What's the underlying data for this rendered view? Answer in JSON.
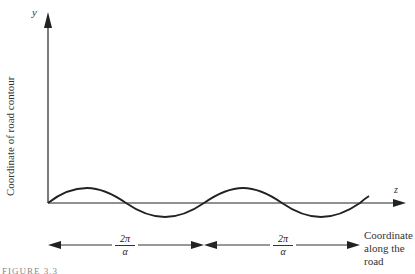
{
  "diagram": {
    "y_axis_symbol": "y",
    "z_axis_symbol": "z",
    "y_axis_label": "Coordinate of road contour",
    "x_axis_label_lines": [
      "Coordinate",
      "along the",
      "road"
    ],
    "wavelength_labels": [
      {
        "numerator": "2π",
        "denominator": "α"
      },
      {
        "numerator": "2π",
        "denominator": "α"
      }
    ],
    "caption_partial": "FIGURE 3.3",
    "curve": "sinusoid",
    "periods_shown": 2,
    "stroke_color": "#222222"
  }
}
